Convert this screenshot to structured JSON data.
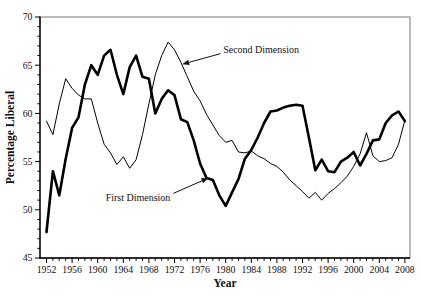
{
  "figure": {
    "background": "#ffffff",
    "frame_color": "#7a7a7a",
    "axis_color": "#000000",
    "text_color": "#111111"
  },
  "chart_data": {
    "type": "line",
    "title": "",
    "xlabel": "Year",
    "ylabel": "Percentage Liberal",
    "xlim": [
      1952,
      2008
    ],
    "ylim": [
      45,
      70
    ],
    "x_tick_label_step": 4,
    "x_minor_tick_step": 1,
    "y_tick_label_step": 5,
    "y_minor_tick_step": 1,
    "x_tick_labels": [
      1952,
      1956,
      1960,
      1964,
      1968,
      1972,
      1976,
      1980,
      1984,
      1988,
      1992,
      1996,
      2000,
      2004,
      2008
    ],
    "y_tick_labels": [
      45,
      50,
      55,
      60,
      65,
      70
    ],
    "grid": false,
    "legend_position": "inline-annotations",
    "x": [
      1952,
      1953,
      1954,
      1955,
      1956,
      1957,
      1958,
      1959,
      1960,
      1961,
      1962,
      1963,
      1964,
      1965,
      1966,
      1967,
      1968,
      1969,
      1970,
      1971,
      1972,
      1973,
      1974,
      1975,
      1976,
      1977,
      1978,
      1979,
      1980,
      1981,
      1982,
      1983,
      1984,
      1985,
      1986,
      1987,
      1988,
      1989,
      1990,
      1991,
      1992,
      1993,
      1994,
      1995,
      1996,
      1997,
      1998,
      1999,
      2000,
      2001,
      2002,
      2003,
      2004,
      2005,
      2006,
      2007,
      2008
    ],
    "series": [
      {
        "name": "First Dimension",
        "color": "#000000",
        "stroke_width": 2.6,
        "values": [
          47.7,
          54.0,
          51.5,
          55.3,
          58.5,
          59.6,
          63.0,
          65.0,
          64.0,
          66.0,
          66.6,
          64.0,
          62.0,
          64.8,
          66.0,
          63.8,
          63.6,
          60.0,
          61.5,
          62.4,
          61.9,
          59.4,
          59.1,
          57.2,
          54.8,
          53.3,
          53.1,
          51.5,
          50.4,
          51.8,
          53.2,
          55.3,
          56.2,
          57.5,
          59.0,
          60.2,
          60.3,
          60.6,
          60.8,
          60.9,
          60.8,
          57.5,
          54.1,
          55.2,
          54.0,
          53.9,
          55.0,
          55.4,
          56.0,
          54.6,
          55.8,
          57.2,
          57.3,
          59.0,
          59.8,
          60.2,
          59.2
        ]
      },
      {
        "name": "Second Dimension",
        "color": "#000000",
        "stroke_width": 1.0,
        "values": [
          59.2,
          57.8,
          61.0,
          63.6,
          62.6,
          61.9,
          61.5,
          61.5,
          59.0,
          56.8,
          55.9,
          54.7,
          55.5,
          54.3,
          55.2,
          57.8,
          61.0,
          64.0,
          66.0,
          67.4,
          66.6,
          65.3,
          63.8,
          62.3,
          61.3,
          59.9,
          58.8,
          57.7,
          57.0,
          57.2,
          56.0,
          55.9,
          56.1,
          55.6,
          55.3,
          54.8,
          54.5,
          53.9,
          53.1,
          52.5,
          51.9,
          51.2,
          51.8,
          51.0,
          51.7,
          52.2,
          52.8,
          53.5,
          54.5,
          55.8,
          58.0,
          55.6,
          55.0,
          55.1,
          55.4,
          56.8,
          59.3
        ]
      }
    ],
    "annotations": [
      {
        "text": "Second Dimension",
        "series": "Second Dimension",
        "anchor": "start",
        "text_year": 1979.6,
        "text_value": 66.6,
        "arrow_start_year": 1979.2,
        "arrow_start_value": 66.2,
        "target_year": 1973.2,
        "target_value": 65.1
      },
      {
        "text": "First Dimension",
        "series": "First Dimension",
        "anchor": "middle",
        "text_year": 1966.3,
        "text_value": 51.3,
        "arrow_start_year": 1971.8,
        "arrow_start_value": 51.7,
        "target_year": 1977.3,
        "target_value": 53.3
      }
    ]
  }
}
